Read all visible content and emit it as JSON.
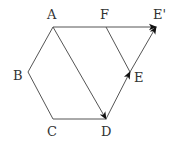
{
  "diagram": {
    "title": "",
    "colors": {
      "line": "#555555",
      "arrow": "#111111",
      "label": "#333333"
    },
    "points": [
      {
        "id": "A",
        "label": "A",
        "x": 53,
        "y": 27,
        "lx": 47,
        "ly": 19
      },
      {
        "id": "F",
        "label": "F",
        "x": 106,
        "y": 27,
        "lx": 100,
        "ly": 19
      },
      {
        "id": "E2",
        "label": "E'",
        "x": 156,
        "y": 27,
        "lx": 153,
        "ly": 19
      },
      {
        "id": "B",
        "label": "B",
        "x": 28,
        "y": 72,
        "lx": 13,
        "ly": 80
      },
      {
        "id": "E",
        "label": "E",
        "x": 130,
        "y": 72,
        "lx": 134,
        "ly": 82
      },
      {
        "id": "C",
        "label": "C",
        "x": 53,
        "y": 119,
        "lx": 47,
        "ly": 136
      },
      {
        "id": "D",
        "label": "D",
        "x": 106,
        "y": 119,
        "lx": 101,
        "ly": 136
      }
    ],
    "edges": [
      {
        "from": "A",
        "to": "B",
        "arrow": false
      },
      {
        "from": "B",
        "to": "C",
        "arrow": false
      },
      {
        "from": "C",
        "to": "D",
        "arrow": false
      },
      {
        "from": "A",
        "to": "E2",
        "arrow": true
      },
      {
        "from": "F",
        "to": "E",
        "arrow": false
      },
      {
        "from": "A",
        "to": "D",
        "arrow": true
      },
      {
        "from": "D",
        "to": "E",
        "arrow": true
      },
      {
        "from": "E",
        "to": "E2",
        "arrow": true
      }
    ]
  }
}
